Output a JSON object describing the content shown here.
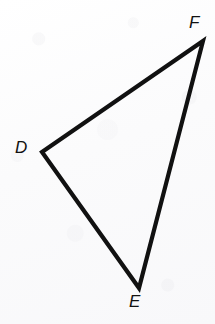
{
  "figure": {
    "name": "triangle-DEF",
    "kind": "geometry-diagram",
    "shape": "triangle",
    "width": 215,
    "height": 324,
    "background_color": "#fcfcfd",
    "stroke_color": "#111111",
    "stroke_width": 4.2,
    "label_color": "#111111",
    "vertices": [
      {
        "label": "D",
        "x": 42,
        "y": 152,
        "label_x": 15,
        "label_y": 139
      },
      {
        "label": "E",
        "x": 139,
        "y": 288,
        "label_x": 129,
        "label_y": 293
      },
      {
        "label": "F",
        "x": 203,
        "y": 41,
        "label_x": 189,
        "label_y": 14
      }
    ],
    "sides": [
      {
        "name": "DF",
        "from": "D",
        "to": "F"
      },
      {
        "name": "FE",
        "from": "F",
        "to": "E"
      },
      {
        "name": "ED",
        "from": "E",
        "to": "D"
      }
    ],
    "path": "M 42 152 L 203 41 L 139 288 Z",
    "labels": {
      "D": "D",
      "E": "E",
      "F": "F"
    }
  }
}
